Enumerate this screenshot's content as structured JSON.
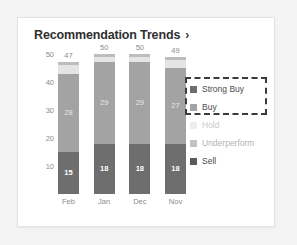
{
  "card": {
    "title": "Recommendation Trends",
    "chevron": "›"
  },
  "chart_data": {
    "type": "bar",
    "title": "Recommendation Trends",
    "xlabel": "",
    "ylabel": "",
    "ylim": [
      0,
      50
    ],
    "yticks": [
      50,
      40,
      30,
      20,
      10
    ],
    "grid": false,
    "stacked": true,
    "legend_position": "right",
    "categories": [
      "Feb",
      "Jan",
      "Dec",
      "Nov"
    ],
    "totals": [
      47,
      50,
      50,
      49
    ],
    "series": [
      {
        "name": "Strong Buy",
        "color": "#6e6e6e",
        "values": [
          15,
          18,
          18,
          18
        ]
      },
      {
        "name": "Buy",
        "color": "#a3a3a3",
        "values": [
          28,
          29,
          29,
          27
        ]
      },
      {
        "name": "Hold",
        "color": "#e4e4e4",
        "values": [
          3,
          2,
          2,
          3
        ]
      },
      {
        "name": "Underperform",
        "color": "#bdbdbd",
        "values": [
          1,
          1,
          1,
          1
        ]
      },
      {
        "name": "Sell",
        "color": "#5a5a5a",
        "values": [
          0,
          0,
          0,
          0
        ]
      }
    ],
    "legend": [
      {
        "label": "Strong Buy",
        "color": "#6e6e6e",
        "state": "active"
      },
      {
        "label": "Buy",
        "color": "#a3a3a3",
        "state": "active"
      },
      {
        "label": "Hold",
        "color": "#ededed",
        "state": "disabled"
      },
      {
        "label": "Underperform",
        "color": "#c2c2c2",
        "state": "muted"
      },
      {
        "label": "Sell",
        "color": "#5a5a5a",
        "state": "normal"
      }
    ],
    "selection": {
      "items": [
        "Strong Buy",
        "Buy"
      ],
      "style": "dashed-box"
    }
  }
}
